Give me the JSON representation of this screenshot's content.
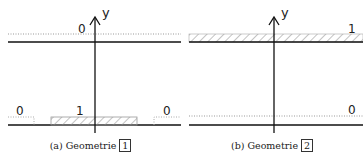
{
  "figure": {
    "axis_label": "y",
    "panels": [
      {
        "id": "a",
        "caption_prefix": "(a) Geometrie",
        "caption_number": "1",
        "labels": {
          "top": "0",
          "bottom_left": "0",
          "bottom_center": "1",
          "bottom_right": "0"
        }
      },
      {
        "id": "b",
        "caption_prefix": "(b) Geometrie",
        "caption_number": "2",
        "labels": {
          "top_right": "1",
          "bottom_right": "0"
        }
      }
    ],
    "colors": {
      "line": "#111111",
      "dotted": "#999999",
      "hatch": "#888888"
    }
  }
}
